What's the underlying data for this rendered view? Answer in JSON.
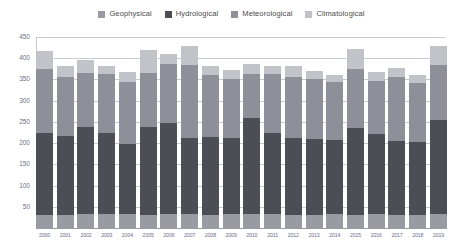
{
  "chart_data": {
    "type": "bar",
    "stacked": true,
    "title": "",
    "subtitle": "",
    "xlabel": "",
    "ylabel": "",
    "ylim": [
      0,
      450
    ],
    "yticks": [
      50,
      100,
      150,
      200,
      250,
      300,
      350,
      400,
      450
    ],
    "grid": true,
    "legend_position": "top-center",
    "categories": [
      "2000",
      "2001",
      "2002",
      "2003",
      "2004",
      "2005",
      "2006",
      "2007",
      "2008",
      "2009",
      "2010",
      "2011",
      "2012",
      "2013",
      "2014",
      "2015",
      "2016",
      "2017",
      "2018",
      "2019"
    ],
    "series": [
      {
        "name": "Geophysical",
        "color": "#9a9aa3",
        "values": [
          30,
          30,
          32,
          33,
          32,
          30,
          32,
          33,
          31,
          34,
          34,
          32,
          30,
          31,
          32,
          30,
          32,
          31,
          30,
          33
        ]
      },
      {
        "name": "Hydrological",
        "color": "#4d4d55",
        "values": [
          195,
          188,
          205,
          190,
          165,
          208,
          215,
          180,
          184,
          178,
          225,
          192,
          182,
          178,
          176,
          205,
          190,
          175,
          172,
          222
        ]
      },
      {
        "name": "Meteorological",
        "color": "#8f8f99",
        "values": [
          150,
          138,
          128,
          140,
          148,
          128,
          140,
          170,
          145,
          140,
          105,
          138,
          145,
          142,
          135,
          140,
          125,
          150,
          140,
          130
        ]
      },
      {
        "name": "Climatological",
        "color": "#c2c2c9",
        "values": [
          43,
          25,
          30,
          18,
          22,
          53,
          22,
          45,
          22,
          21,
          22,
          20,
          25,
          18,
          18,
          48,
          20,
          22,
          18,
          45
        ]
      }
    ],
    "totals": [
      418,
      381,
      395,
      381,
      367,
      419,
      409,
      428,
      382,
      373,
      386,
      382,
      382,
      369,
      361,
      423,
      367,
      378,
      360,
      430
    ]
  },
  "legend": {
    "items": [
      {
        "label": "Geophysical",
        "color": "#9a9aa3"
      },
      {
        "label": "Hydrological",
        "color": "#4d4d55"
      },
      {
        "label": "Meteorological",
        "color": "#8f8f99"
      },
      {
        "label": "Climatological",
        "color": "#c2c2c9"
      }
    ]
  },
  "axis": {
    "y_labels": [
      "450",
      "400",
      "350",
      "300",
      "250",
      "200",
      "150",
      "100",
      "50"
    ],
    "x_labels": [
      "2000",
      "2001",
      "2002",
      "2003",
      "2004",
      "2005",
      "2006",
      "2007",
      "2008",
      "2009",
      "2010",
      "2011",
      "2012",
      "2013",
      "2014",
      "2015",
      "2016",
      "2017",
      "2018",
      "2019"
    ]
  },
  "colors": {
    "grid": "#c9c9d6",
    "axis_text": "#6d6d8a",
    "legend_text": "#4a4a4a",
    "background": "#ffffff"
  }
}
